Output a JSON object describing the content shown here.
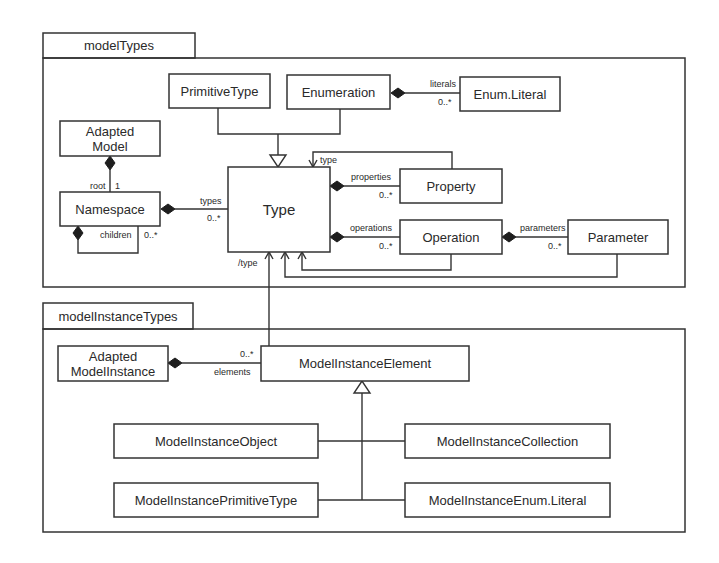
{
  "packages": [
    {
      "id": "modelTypes",
      "label": "modelTypes"
    },
    {
      "id": "modelInstanceTypes",
      "label": "modelInstanceTypes"
    }
  ],
  "classes": {
    "primitiveType": "PrimitiveType",
    "enumeration": "Enumeration",
    "enumLiteral": "Enum.Literal",
    "adaptedModel": [
      "Adapted",
      "Model"
    ],
    "namespace": "Namespace",
    "type": "Type",
    "property": "Property",
    "operation": "Operation",
    "parameter": "Parameter",
    "adaptedModelInstance": [
      "Adapted",
      "ModelInstance"
    ],
    "modelInstanceElement": "ModelInstanceElement",
    "modelInstanceObject": "ModelInstanceObject",
    "modelInstanceCollection": "ModelInstanceCollection",
    "modelInstancePrimitiveType": "ModelInstancePrimitiveType",
    "modelInstanceEnumLiteral": "ModelInstanceEnum.Literal"
  },
  "associations": {
    "literals": {
      "role": "literals",
      "multiplicity": "0..*"
    },
    "root": {
      "role": "root",
      "multiplicity": "1"
    },
    "types": {
      "role": "types",
      "multiplicity": "0..*"
    },
    "children": {
      "role": "children",
      "multiplicity": "0..*"
    },
    "propertyType": {
      "role": "type"
    },
    "properties": {
      "role": "properties",
      "multiplicity": "0..*"
    },
    "operations": {
      "role": "operations",
      "multiplicity": "0..*"
    },
    "parameters": {
      "role": "parameters",
      "multiplicity": "0..*"
    },
    "derivedType": {
      "role": "/type"
    },
    "elements": {
      "role": "elements",
      "multiplicity": "0..*"
    }
  }
}
